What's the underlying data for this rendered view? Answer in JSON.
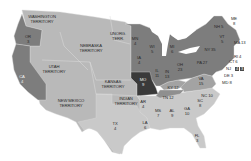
{
  "map": {
    "title": "",
    "colors": {
      "background": "#ffffff",
      "territory": "#b9b9b9",
      "north_state": "#7d7d7d",
      "south_state": "#c9c9c9",
      "border_state": "#a3a3a3",
      "missouri": "#3a3a3a",
      "nj_split": "#4a4a4a",
      "border_line": "#dcdcdc"
    },
    "regions": {
      "washington": {
        "name": "WASHINGTON",
        "sub": "TERRITORY"
      },
      "or": {
        "name": "OR",
        "votes": "3"
      },
      "ca": {
        "name": "CA",
        "votes": "4"
      },
      "utah": {
        "name": "UTAH",
        "sub": "TERRITORY"
      },
      "nebraska": {
        "name": "NEBRASKA",
        "sub": "TERRITORY"
      },
      "unorg": {
        "name": "UNORG.",
        "sub": "TERR."
      },
      "newmexico": {
        "name": "NEW MEXICO",
        "sub": "TERRITORY"
      },
      "kansas": {
        "name": "KANSAS",
        "sub": "TERRITORY"
      },
      "indian": {
        "name": "INDIAN",
        "sub": "TERRITORY"
      },
      "tx": {
        "name": "TX",
        "votes": "4"
      },
      "mn": {
        "name": "MN",
        "votes": "4"
      },
      "wi": {
        "name": "WI",
        "votes": "5"
      },
      "ia": {
        "name": "IA",
        "votes": "4"
      },
      "mi": {
        "name": "MI",
        "votes": "6"
      },
      "il": {
        "name": "IL",
        "votes": "11"
      },
      "in": {
        "name": "IN",
        "votes": "13"
      },
      "oh": {
        "name": "OH",
        "votes": "23"
      },
      "pa": {
        "name": "PA",
        "votes": "27"
      },
      "ny": {
        "name": "NY",
        "votes": "35"
      },
      "vt": {
        "name": "VT",
        "votes": "5"
      },
      "me": {
        "name": "ME",
        "votes": "8"
      },
      "nh": {
        "name": "NH 5"
      },
      "ma": {
        "name": "MA 13"
      },
      "ri": {
        "name": "RI 4"
      },
      "ct": {
        "name": "CT 6"
      },
      "nj": {
        "name": "NJ",
        "votes_a": "4",
        "votes_b": "3"
      },
      "de": {
        "name": "DE 3"
      },
      "md": {
        "name": "MD 8"
      },
      "mo": {
        "name": "MO",
        "votes": "9"
      },
      "ky": {
        "name": "KY 12"
      },
      "tn": {
        "name": "TN 12"
      },
      "va": {
        "name": "VA",
        "votes": "15"
      },
      "nc": {
        "name": "NC 10"
      },
      "sc": {
        "name": "SC",
        "votes": "8"
      },
      "ar": {
        "name": "AR",
        "votes": "4"
      },
      "ms": {
        "name": "MS",
        "votes": "7"
      },
      "al": {
        "name": "AL",
        "votes": "9"
      },
      "ga": {
        "name": "GA",
        "votes": "10"
      },
      "la": {
        "name": "LA",
        "votes": "6"
      },
      "fl": {
        "name": "FL",
        "votes": "3"
      }
    }
  }
}
